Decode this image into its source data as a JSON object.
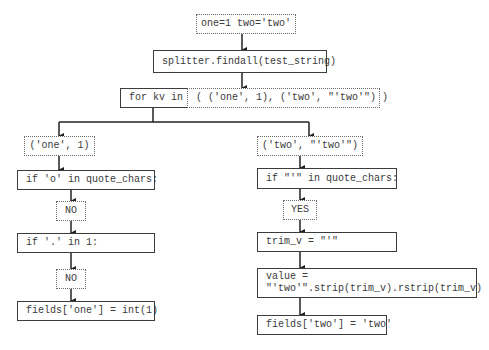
{
  "diagram": {
    "input": "one=1 two='two'",
    "findall": "splitter.findall(test_string)",
    "loop_label": "for kv in",
    "loop_items": "( ('one', 1), ('two', \"'two'\") )",
    "left": {
      "item": "('one', 1)",
      "check_quote": "if 'o' in quote_chars:",
      "quote_result": "NO",
      "check_dot": "if '.' in 1:",
      "dot_result": "NO",
      "assign": "fields['one'] = int(1)"
    },
    "right": {
      "item": "('two', \"'two'\")",
      "check_quote": "if \"'\" in quote_chars:",
      "quote_result": "YES",
      "trim": "trim_v = \"'\"",
      "value_line1": "value =",
      "value_line2": "\"'two'\".strip(trim_v).rstrip(trim_v)",
      "assign": "fields['two'] = 'two'"
    }
  },
  "colors": {
    "line": "#222222",
    "solid_border": "#3c3c3c",
    "dotted_border": "#6a6a6a",
    "text": "#3a3a3a"
  }
}
